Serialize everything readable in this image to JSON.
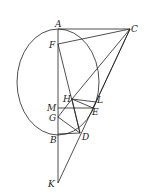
{
  "diagram": {
    "type": "geometry",
    "ellipse": {
      "cx": 58,
      "cy": 82,
      "rx": 41,
      "ry": 53
    },
    "points": {
      "A": {
        "x": 58,
        "y": 29,
        "lx": 55,
        "ly": 27
      },
      "C": {
        "x": 130,
        "y": 29,
        "lx": 131,
        "ly": 32
      },
      "F": {
        "x": 58,
        "y": 44,
        "lx": 49,
        "ly": 48
      },
      "H": {
        "x": 72,
        "y": 99,
        "lx": 63,
        "ly": 102
      },
      "L": {
        "x": 96,
        "y": 102,
        "lx": 97,
        "ly": 103
      },
      "E": {
        "x": 93,
        "y": 108,
        "lx": 92,
        "ly": 115
      },
      "M": {
        "x": 58,
        "y": 108,
        "lx": 47,
        "ly": 111
      },
      "G": {
        "x": 58,
        "y": 117,
        "lx": 49,
        "ly": 121
      },
      "B": {
        "x": 58,
        "y": 134,
        "lx": 50,
        "ly": 143
      },
      "D": {
        "x": 80,
        "y": 133,
        "lx": 82,
        "ly": 140
      },
      "K": {
        "x": 58,
        "y": 183,
        "lx": 48,
        "ly": 187
      }
    },
    "labels": [
      "A",
      "C",
      "F",
      "H",
      "L",
      "E",
      "M",
      "G",
      "B",
      "D",
      "K"
    ],
    "segments": [
      [
        "A",
        "K"
      ],
      [
        "A",
        "C"
      ],
      [
        "F",
        "C"
      ],
      [
        "C",
        "K"
      ],
      [
        "C",
        "H"
      ],
      [
        "C",
        "L"
      ],
      [
        "F",
        "D"
      ],
      [
        "H",
        "L"
      ],
      [
        "H",
        "E"
      ],
      [
        "L",
        "E"
      ],
      [
        "M",
        "E"
      ],
      [
        "G",
        "H"
      ],
      [
        "G",
        "D"
      ],
      [
        "B",
        "D"
      ],
      [
        "H",
        "D"
      ]
    ]
  }
}
